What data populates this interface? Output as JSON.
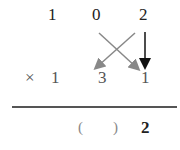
{
  "problem": {
    "top_row": [
      "1",
      "0",
      "2"
    ],
    "multiplier_row": {
      "sign": "×",
      "digits": [
        "1",
        "3",
        "1"
      ]
    },
    "result_row": {
      "blank": "(　　)",
      "last_digit": "2"
    }
  },
  "arrows": [
    {
      "from": "2 (top)",
      "to": "3 position",
      "color": "#888888"
    },
    {
      "from": "0 (top)",
      "to": "1 position",
      "color": "#888888"
    },
    {
      "from": "2 (top)",
      "to": "1 (last)",
      "color": "#111111"
    }
  ]
}
